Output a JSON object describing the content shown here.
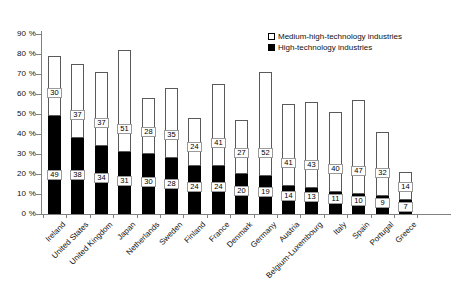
{
  "chart_data": {
    "type": "bar",
    "stacked": true,
    "title": "",
    "subtitle": "",
    "xlabel": "",
    "ylabel": "",
    "ylim": [
      0,
      90
    ],
    "ytick_values": [
      0,
      10,
      20,
      30,
      40,
      50,
      60,
      70,
      80,
      90
    ],
    "ytick_labels": [
      "0 %",
      "10 %",
      "20 %",
      "30 %",
      "40 %",
      "50 %",
      "60 %",
      "70 %",
      "80 %",
      "90 %"
    ],
    "grid": false,
    "legend_position": "top-right",
    "categories": [
      "Ireland",
      "United States",
      "United Kingdom",
      "Japan",
      "Netherlands",
      "Sweden",
      "Finland",
      "France",
      "Denmark",
      "Germany",
      "Austria",
      "Belgium-Luxembourg",
      "Italy",
      "Spain",
      "Portugal",
      "Greece"
    ],
    "series": [
      {
        "name": "High-technology industries",
        "color": "#000000",
        "values": [
          49,
          38,
          34,
          31,
          30,
          28,
          24,
          24,
          20,
          19,
          14,
          13,
          11,
          10,
          9,
          7
        ]
      },
      {
        "name": "Medium-high-technology industries",
        "color": "#ffffff",
        "values": [
          30,
          37,
          37,
          51,
          28,
          35,
          24,
          41,
          27,
          52,
          41,
          43,
          40,
          47,
          32,
          14
        ]
      }
    ],
    "totals": [
      79,
      75,
      71,
      82,
      58,
      63,
      48,
      65,
      47,
      71,
      55,
      56,
      51,
      57,
      41,
      21
    ]
  },
  "legend": {
    "items": [
      {
        "label": "Medium-high-technology industries",
        "swatch": "white-square"
      },
      {
        "label": "High-technology industries",
        "swatch": "black-square"
      }
    ]
  }
}
